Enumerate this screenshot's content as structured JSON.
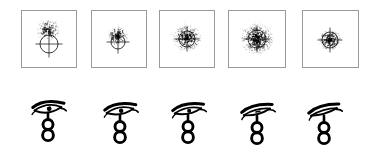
{
  "figure": {
    "background_color": "#ffffff",
    "ink_color": "#000000",
    "frame_color": "#9a9a9a",
    "row_count": 2,
    "column_count": 5
  },
  "top_row": {
    "row_label": "framed-burst-panels",
    "box_width": 56,
    "box_height": 58,
    "panels": [
      {
        "index": 1,
        "label": "panel-1",
        "x": 21,
        "box_width": 56,
        "box_height": 58,
        "symbol_name": "crosshair-circle",
        "symbol_cx": 28,
        "symbol_cy": 34,
        "symbol_radius": 9,
        "burst_name": "stipple-burst",
        "burst_cx": 27,
        "burst_cy": 20,
        "burst_radius": 11,
        "burst_density": 140,
        "burst_intensity": "light",
        "burst_offset": "above"
      },
      {
        "index": 2,
        "label": "panel-2",
        "x": 91,
        "box_width": 56,
        "box_height": 58,
        "symbol_name": "crosshair-circle",
        "symbol_cx": 27,
        "symbol_cy": 32,
        "symbol_radius": 7,
        "burst_name": "stipple-burst",
        "burst_cx": 27,
        "burst_cy": 26,
        "burst_radius": 10,
        "burst_density": 150,
        "burst_intensity": "light",
        "burst_offset": "slightly-above"
      },
      {
        "index": 3,
        "label": "panel-3",
        "x": 159,
        "box_width": 56,
        "box_height": 58,
        "symbol_name": "crosshair-circle",
        "symbol_cx": 28,
        "symbol_cy": 29,
        "symbol_radius": 8,
        "burst_name": "stipple-burst",
        "burst_cx": 28,
        "burst_cy": 28,
        "burst_radius": 14,
        "burst_density": 260,
        "burst_intensity": "medium",
        "burst_offset": "centered"
      },
      {
        "index": 4,
        "label": "panel-4",
        "x": 228,
        "box_width": 58,
        "box_height": 58,
        "symbol_name": "crosshair-circle",
        "symbol_cx": 29,
        "symbol_cy": 29,
        "symbol_radius": 9,
        "burst_name": "stipple-burst",
        "burst_cx": 29,
        "burst_cy": 29,
        "burst_radius": 16,
        "burst_density": 380,
        "burst_intensity": "dense",
        "burst_offset": "centered"
      },
      {
        "index": 5,
        "label": "panel-5",
        "x": 302,
        "box_width": 57,
        "box_height": 58,
        "symbol_name": "crosshair-circle",
        "symbol_cx": 28,
        "symbol_cy": 30,
        "symbol_radius": 8,
        "burst_name": "stipple-burst",
        "burst_cx": 28,
        "burst_cy": 30,
        "burst_radius": 11,
        "burst_density": 190,
        "burst_intensity": "medium",
        "burst_offset": "centered"
      }
    ]
  },
  "bottom_row": {
    "row_label": "eye-of-horus-glyphs",
    "glyphs": [
      {
        "index": 1,
        "label": "glyph-1",
        "x": 26,
        "y": 14,
        "eye_name": "eye-of-horus",
        "stem_name": "double-circle-stem",
        "eye_openness": "wide-open",
        "eye_tilt_deg": -6,
        "pupil_visible": true,
        "brow_style": "thick-arched",
        "stem_circles": 2
      },
      {
        "index": 2,
        "label": "glyph-2",
        "x": 98,
        "y": 16,
        "eye_name": "eye-of-horus",
        "stem_name": "double-circle-stem",
        "eye_openness": "open",
        "eye_tilt_deg": -8,
        "pupil_visible": true,
        "brow_style": "thick-arched",
        "stem_circles": 2
      },
      {
        "index": 3,
        "label": "glyph-3",
        "x": 166,
        "y": 16,
        "eye_name": "eye-of-horus",
        "stem_name": "double-circle-stem",
        "eye_openness": "half-open",
        "eye_tilt_deg": -10,
        "pupil_visible": true,
        "brow_style": "thick-arched",
        "stem_circles": 2
      },
      {
        "index": 4,
        "label": "glyph-4",
        "x": 235,
        "y": 17,
        "eye_name": "eye-of-horus",
        "stem_name": "double-circle-stem",
        "eye_openness": "narrow",
        "eye_tilt_deg": -13,
        "pupil_visible": false,
        "brow_style": "thick-arched",
        "stem_circles": 2
      },
      {
        "index": 5,
        "label": "glyph-5",
        "x": 302,
        "y": 17,
        "eye_name": "eye-of-horus",
        "stem_name": "double-circle-stem",
        "eye_openness": "closed",
        "eye_tilt_deg": -15,
        "pupil_visible": false,
        "brow_style": "thick-arched",
        "stem_circles": 2
      }
    ]
  }
}
